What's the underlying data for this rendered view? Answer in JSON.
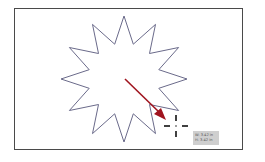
{
  "canvas": {
    "frame_color": "#4a4a4a",
    "background": "#ffffff"
  },
  "star": {
    "icon": "star-shape",
    "points": 12,
    "stroke": "#6a6a8a",
    "fill": "#ffffff"
  },
  "arrow": {
    "icon": "drag-direction-arrow",
    "color": "#a0141e"
  },
  "cursor": {
    "icon": "crosshair-cursor"
  },
  "tooltip": {
    "width_label": "W: 3.42 in",
    "height_label": "H: 3.42 in"
  }
}
